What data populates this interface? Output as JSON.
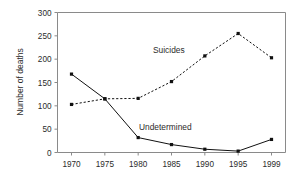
{
  "chart_data": {
    "type": "line",
    "title": "",
    "xlabel": "",
    "ylabel": "Number of deaths",
    "categories": [
      "1970",
      "1975",
      "1980",
      "1985",
      "1990",
      "1995",
      "1999"
    ],
    "xtick_labels": [
      "1970",
      "1975",
      "1980",
      "1985",
      "1990",
      "1995",
      "1999"
    ],
    "ytick_labels": [
      "0",
      "50",
      "100",
      "150",
      "200",
      "250",
      "300"
    ],
    "ytick_values": [
      0,
      50,
      100,
      150,
      200,
      250,
      300
    ],
    "ylim": [
      0,
      300
    ],
    "grid": false,
    "legend_position": "inline-annotation",
    "series": [
      {
        "name": "Suicides",
        "label": "Suicides",
        "style": "dashed",
        "marker": "square",
        "color": "#111111",
        "values": [
          103,
          115,
          116,
          152,
          207,
          255,
          203
        ]
      },
      {
        "name": "Undetermined",
        "label": "Undetermined",
        "style": "solid",
        "marker": "square",
        "color": "#111111",
        "values": [
          168,
          115,
          32,
          17,
          7,
          3,
          28
        ]
      }
    ],
    "annotations": [
      {
        "text": "Suicides",
        "x_value": "1985",
        "y_value": 197
      },
      {
        "text": "Undetermined",
        "x_value": "1987",
        "y_value": 58
      }
    ]
  },
  "figure": {
    "background_color": "#ffffff",
    "axis_color": "#8a8a8a",
    "line_color": "#111111"
  }
}
